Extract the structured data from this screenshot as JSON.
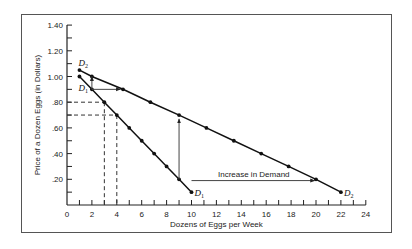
{
  "chart_data": {
    "type": "line",
    "title": "",
    "xlabel": "Dozens of Eggs per Week",
    "ylabel": "Price of a Dozen Eggs (in Dollars)",
    "xlim": [
      0,
      24
    ],
    "ylim": [
      0,
      1.4
    ],
    "x_ticks": [
      0,
      2,
      4,
      6,
      8,
      10,
      12,
      14,
      16,
      18,
      20,
      22,
      24
    ],
    "x_tick_labels": [
      "0",
      "2",
      "4",
      "6",
      "8",
      "10",
      "12",
      "14",
      "16",
      "18",
      "20",
      "22",
      "24"
    ],
    "x_minor_step": 1,
    "y_ticks": [
      0.2,
      0.4,
      0.6,
      0.8,
      1.0,
      1.2,
      1.4
    ],
    "y_tick_labels": [
      ".20",
      ".40",
      ".60",
      ".80",
      "1.00",
      "1.20",
      "1.40"
    ],
    "y_minor_step": 0.1,
    "grid": false,
    "legend": null,
    "series": [
      {
        "name": "D1",
        "label_main": "D",
        "label_sub": "1",
        "points": [
          [
            1,
            1.0
          ],
          [
            2,
            0.9
          ],
          [
            3,
            0.8
          ],
          [
            4,
            0.7
          ],
          [
            5,
            0.6
          ],
          [
            6,
            0.5
          ],
          [
            7,
            0.4
          ],
          [
            8,
            0.3
          ],
          [
            9,
            0.2
          ],
          [
            10,
            0.1
          ]
        ]
      },
      {
        "name": "D2",
        "label_main": "D",
        "label_sub": "2",
        "points": [
          [
            1,
            1.05
          ],
          [
            2,
            1.0
          ],
          [
            4.5,
            0.9
          ],
          [
            6.7,
            0.8
          ],
          [
            9,
            0.7
          ],
          [
            11.2,
            0.6
          ],
          [
            13.4,
            0.5
          ],
          [
            15.6,
            0.4
          ],
          [
            17.8,
            0.3
          ],
          [
            20,
            0.2
          ],
          [
            22,
            0.1
          ]
        ]
      }
    ],
    "dashed_guides": [
      {
        "q": 3,
        "p": 0.8
      },
      {
        "q": 4,
        "p": 0.7
      }
    ],
    "arrows": [
      {
        "from": [
          2,
          0.9
        ],
        "to": [
          2,
          1.0
        ],
        "style": "solid"
      },
      {
        "from": [
          2,
          0.9
        ],
        "to": [
          4.3,
          0.9
        ],
        "style": "solid"
      },
      {
        "from": [
          9,
          0.2
        ],
        "to": [
          9,
          0.67
        ],
        "style": "solid"
      },
      {
        "from": [
          10,
          0.19
        ],
        "to": [
          19.9,
          0.19
        ],
        "style": "solid"
      }
    ],
    "annotations": [
      {
        "text": "Increase in Demand",
        "x": 15,
        "y": 0.22
      }
    ]
  }
}
